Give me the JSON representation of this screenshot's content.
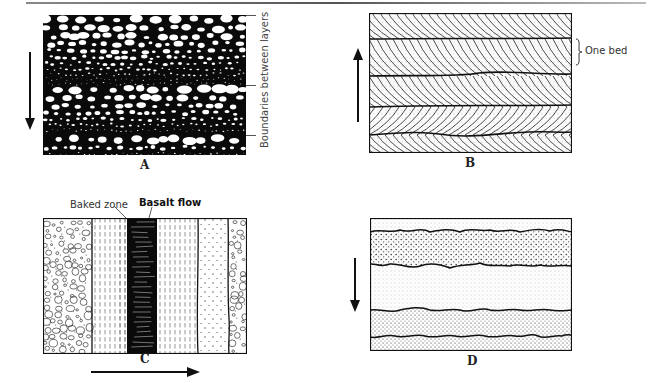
{
  "figure": {
    "panels": [
      {
        "id": "A",
        "label": "A",
        "description": "Graded bedding: layers of coarse clasts fining upward, dark matrix",
        "arrow_direction": "down",
        "annotation": "Boundaries between layers",
        "layer_boundaries": 3
      },
      {
        "id": "B",
        "label": "B",
        "description": "Cross-bedding: stacked beds with inclined laminae",
        "arrow_direction": "up",
        "annotation": "One bed",
        "bed_count": 5
      },
      {
        "id": "C",
        "label": "C",
        "description": "Vertical strata with basalt flow and baked zone",
        "arrow_direction": "right",
        "annotations": [
          "Baked zone",
          "Basalt flow"
        ],
        "columns": [
          "conglomerate",
          "shale",
          "baked zone",
          "basalt flow",
          "shale",
          "sandstone",
          "conglomerate"
        ]
      },
      {
        "id": "D",
        "label": "D",
        "description": "Sandstone layers separated by irregular erosional contacts",
        "arrow_direction": "down",
        "layer_boundaries": 4
      }
    ]
  },
  "labels": {
    "a": "A",
    "b": "B",
    "c": "C",
    "d": "D",
    "boundaries": "Boundaries between layers",
    "one_bed": "One bed",
    "baked_zone": "Baked zone",
    "basalt_flow": "Basalt flow"
  },
  "colors": {
    "ink": "#111111",
    "paper": "#ffffff",
    "stipple": "#555555"
  }
}
